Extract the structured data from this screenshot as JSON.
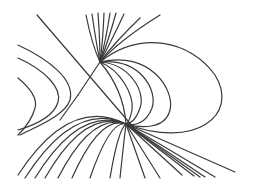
{
  "diagram": {
    "type": "phase-portrait",
    "background": "#ffffff",
    "stroke_color": "#3a3a3a",
    "elements": {
      "saddle_separatrix_diagonal": "straight line from upper-left to lower-right",
      "saddle_separatrix_fan": "straight line from lower-left to upper-right fan focus",
      "node_point": "convergence point near lower center",
      "homoclinic_loop": "large loop on right side",
      "left_trajectories": "curves bending on far left"
    }
  }
}
